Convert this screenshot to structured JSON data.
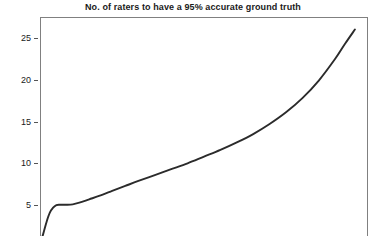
{
  "chart_data": {
    "type": "line",
    "title": "No. of raters to have a 95% accurate ground truth",
    "xlabel": "",
    "ylabel": "",
    "ylim": [
      0,
      27.5
    ],
    "xlim": [
      0,
      100
    ],
    "grid": false,
    "legend": null,
    "y_ticks": [
      5,
      10,
      15,
      20,
      25
    ],
    "y_tick_labels": [
      "5",
      "10",
      "15",
      "20",
      "25"
    ],
    "x_ticks": [],
    "x_tick_labels": [],
    "series": [
      {
        "name": "raters needed",
        "color": "#2b2b2b",
        "x": [
          0,
          1,
          2,
          3,
          4,
          5,
          6,
          7,
          8,
          10,
          12,
          15,
          18,
          22,
          26,
          30,
          35,
          40,
          45,
          50,
          55,
          60,
          65,
          70,
          75,
          80,
          85,
          90,
          93,
          96
        ],
        "values": [
          0.2,
          1.6,
          3.0,
          4.1,
          4.7,
          5.0,
          5.05,
          5.05,
          5.05,
          5.1,
          5.3,
          5.7,
          6.1,
          6.7,
          7.3,
          7.9,
          8.6,
          9.3,
          10.0,
          10.8,
          11.6,
          12.5,
          13.5,
          14.7,
          16.1,
          17.8,
          19.9,
          22.5,
          24.3,
          26.0
        ]
      }
    ]
  },
  "axes": {
    "frame_color": "#808080",
    "tick_color": "#555555",
    "label_color": "#1a1a1a"
  },
  "figure": {
    "background": "#ffffff",
    "title_color": "#1a1a1a"
  }
}
